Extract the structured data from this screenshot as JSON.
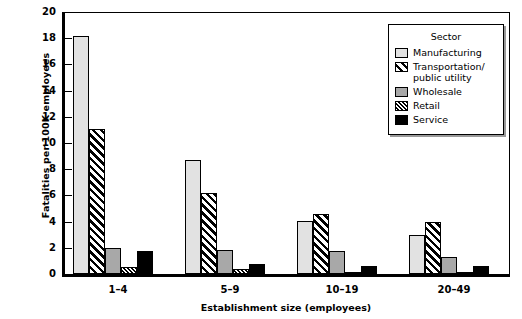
{
  "chart_data": {
    "type": "bar",
    "title": "",
    "xlabel": "Establishment size (employees)",
    "ylabel": "Fatalities per 100K employees",
    "categories": [
      "1–4",
      "5–9",
      "10–19",
      "20–49"
    ],
    "ylim": [
      0,
      20
    ],
    "ytick_values": [
      0,
      2,
      4,
      6,
      8,
      10,
      12,
      14,
      16,
      18,
      20
    ],
    "ytick_labels": [
      "0",
      "2",
      "4",
      "6",
      "8",
      "10",
      "12",
      "14",
      "16",
      "18",
      "20"
    ],
    "grid": false,
    "legend_position": "upper right",
    "legend_title": "Sector",
    "series": [
      {
        "name": "Manufacturing",
        "pattern": "solid-light-gray",
        "color": "#e2e2e2",
        "values": [
          18.2,
          8.7,
          4.05,
          3.0
        ]
      },
      {
        "name": "Transportation/\npublic utility",
        "pattern": "wide-diagonal-hatch",
        "color": "#ffffff",
        "values": [
          11.1,
          6.2,
          4.6,
          3.95
        ]
      },
      {
        "name": "Wholesale",
        "pattern": "solid-medium-gray",
        "color": "#a8a8a8",
        "values": [
          2.0,
          1.8,
          1.75,
          1.3
        ]
      },
      {
        "name": "Retail",
        "pattern": "fine-diagonal-hatch",
        "color": "#ffffff",
        "values": [
          0.55,
          0.4,
          0.15,
          0.15
        ]
      },
      {
        "name": "Service",
        "pattern": "solid-black",
        "color": "#000000",
        "values": [
          1.75,
          0.8,
          0.65,
          0.65
        ]
      }
    ]
  },
  "legend": {
    "title": "Sector",
    "entries": [
      {
        "label": "Manufacturing",
        "key": "manufacturing"
      },
      {
        "label": "Transportation/",
        "label2": "public utility",
        "key": "transportation"
      },
      {
        "label": "Wholesale",
        "key": "wholesale"
      },
      {
        "label": "Retail",
        "key": "retail"
      },
      {
        "label": "Service",
        "key": "service"
      }
    ]
  }
}
